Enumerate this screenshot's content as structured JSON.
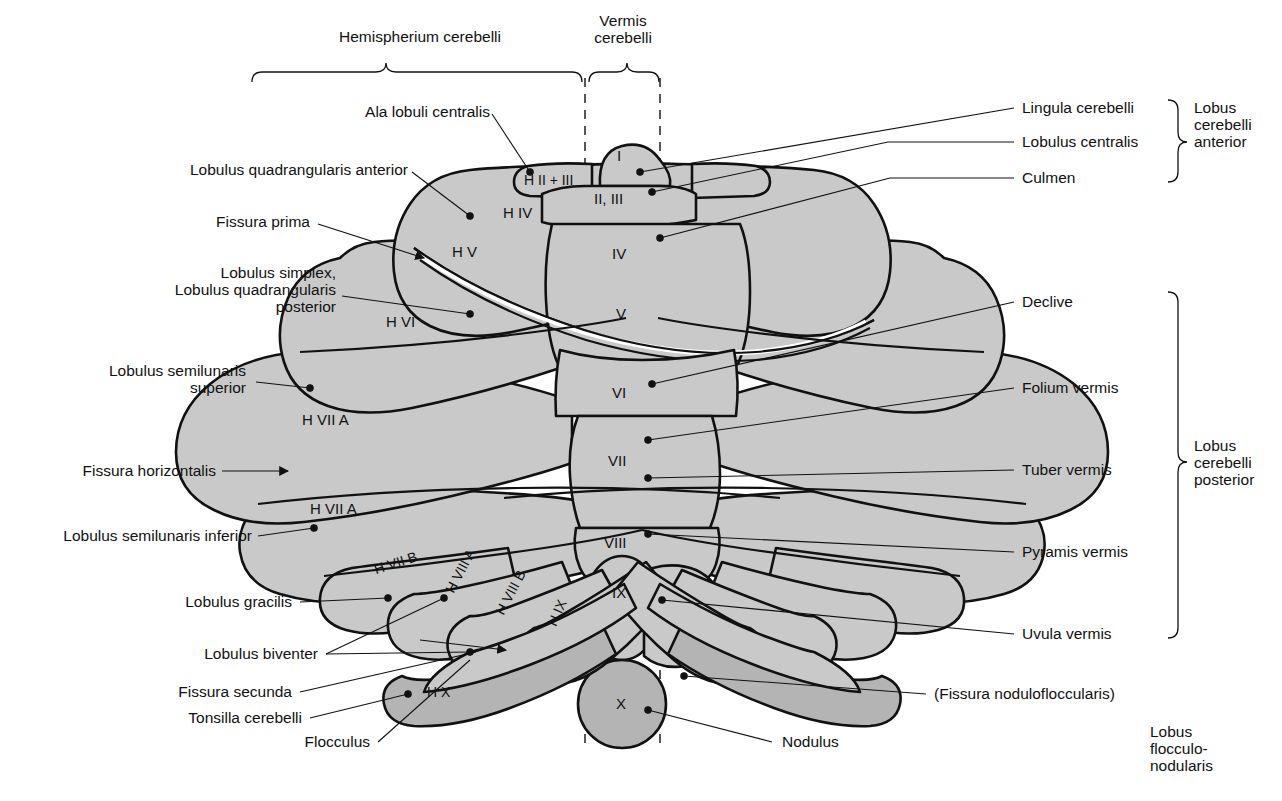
{
  "figure": {
    "fill_gray": "#c9c9c9",
    "fill_gray_dark": "#b4b4b4",
    "stroke": "#111111"
  },
  "top_braces": [
    {
      "name": "hemispherium",
      "label": "Hemispherium cerebelli"
    },
    {
      "name": "vermis",
      "label": "Vermis\ncerebelli"
    }
  ],
  "left_labels": [
    {
      "name": "ala-lobuli-centralis",
      "text": "Ala lobuli centralis"
    },
    {
      "name": "lobulus-quadrangularis-anterior",
      "text": "Lobulus quadrangularis anterior"
    },
    {
      "name": "fissura-prima",
      "text": "Fissura prima"
    },
    {
      "name": "lobulus-simplex",
      "text": "Lobulus simplex,\nLobulus quadrangularis\nposterior"
    },
    {
      "name": "lobulus-semilunaris-superior",
      "text": "Lobulus semilunaris\nsuperior"
    },
    {
      "name": "fissura-horizontalis",
      "text": "Fissura horizontalis"
    },
    {
      "name": "lobulus-semilunaris-inferior",
      "text": "Lobulus semilunaris inferior"
    },
    {
      "name": "lobulus-gracilis",
      "text": "Lobulus gracilis"
    },
    {
      "name": "lobulus-biventer",
      "text": "Lobulus biventer"
    },
    {
      "name": "fissura-secunda",
      "text": "Fissura secunda"
    },
    {
      "name": "tonsilla-cerebelli",
      "text": "Tonsilla cerebelli"
    },
    {
      "name": "flocculus",
      "text": "Flocculus"
    }
  ],
  "right_labels": [
    {
      "name": "lingula-cerebelli",
      "text": "Lingula cerebelli"
    },
    {
      "name": "lobulus-centralis",
      "text": "Lobulus centralis"
    },
    {
      "name": "culmen",
      "text": "Culmen"
    },
    {
      "name": "declive",
      "text": "Declive"
    },
    {
      "name": "folium-vermis",
      "text": "Folium vermis"
    },
    {
      "name": "tuber-vermis",
      "text": "Tuber vermis"
    },
    {
      "name": "pyramis-vermis",
      "text": "Pyramis vermis"
    },
    {
      "name": "uvula-vermis",
      "text": "Uvula vermis"
    },
    {
      "name": "fissura-nodulofloccularis",
      "text": "(Fissura nodulofloccularis)"
    },
    {
      "name": "nodulus",
      "text": "Nodulus"
    }
  ],
  "right_groups": [
    {
      "name": "lobus-cerebelli-anterior",
      "text": "Lobus\ncerebelli\nanterior"
    },
    {
      "name": "lobus-cerebelli-posterior",
      "text": "Lobus\ncerebelli\nposterior"
    },
    {
      "name": "lobus-flocculonodularis",
      "text": "Lobus\nflocculo-\nnodularis"
    }
  ],
  "vermis_segments": [
    {
      "name": "vermis-I",
      "text": "I"
    },
    {
      "name": "vermis-II-III",
      "text": "II, III"
    },
    {
      "name": "vermis-IV",
      "text": "IV"
    },
    {
      "name": "vermis-V",
      "text": "V"
    },
    {
      "name": "vermis-VI",
      "text": "VI"
    },
    {
      "name": "vermis-VII",
      "text": "VII"
    },
    {
      "name": "vermis-VIII",
      "text": "VIII"
    },
    {
      "name": "vermis-IX",
      "text": "IX"
    },
    {
      "name": "vermis-X",
      "text": "X"
    }
  ],
  "hemisphere_segments": [
    {
      "name": "hemi-H-II-III",
      "text": "H II + III"
    },
    {
      "name": "hemi-H-IV",
      "text": "H IV"
    },
    {
      "name": "hemi-H-V",
      "text": "H V"
    },
    {
      "name": "hemi-H-VI",
      "text": "H VI"
    },
    {
      "name": "hemi-H-VII-A-sup",
      "text": "H VII A"
    },
    {
      "name": "hemi-H-VII-A-inf",
      "text": "H VII A"
    },
    {
      "name": "hemi-H-VII-B",
      "text": "H VII B"
    },
    {
      "name": "hemi-H-VIII-A",
      "text": "H VIII A"
    },
    {
      "name": "hemi-H-VIII-B",
      "text": "H VIII B"
    },
    {
      "name": "hemi-H-IX",
      "text": "H IX"
    },
    {
      "name": "hemi-H-X",
      "text": "H X"
    }
  ]
}
